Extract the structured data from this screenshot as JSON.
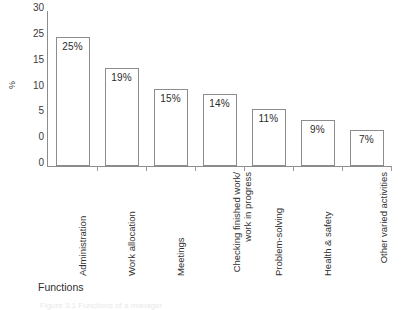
{
  "chart_data": {
    "type": "bar",
    "title": "",
    "xlabel": "Functions",
    "ylabel": "%",
    "ylim": [
      0,
      30
    ],
    "grid": false,
    "legend": false,
    "orientation": "vertical",
    "bar_style": "white fill with gray outline, value label inside top of bar",
    "categories": [
      "Administration",
      "Work allocation",
      "Meetings",
      "Checking finished work/ work in progress",
      "Problem-solving",
      "Health & safety",
      "Other varied activities"
    ],
    "values": [
      25,
      19,
      15,
      14,
      11,
      9,
      7
    ],
    "value_labels": [
      "25%",
      "19%",
      "15%",
      "14%",
      "11%",
      "9%",
      "7%"
    ],
    "ytick_labels": [
      "30",
      "25",
      "15",
      "10",
      "5",
      "0"
    ],
    "ytick_values": [
      30,
      25,
      20,
      15,
      10,
      5
    ],
    "ytick_note": "As printed, the tick in the 20 position reads 15"
  },
  "axes": {
    "y_title": "%",
    "x_title": "Functions"
  },
  "caption": {
    "text": "Figure 3.1  Functions of a manager"
  }
}
